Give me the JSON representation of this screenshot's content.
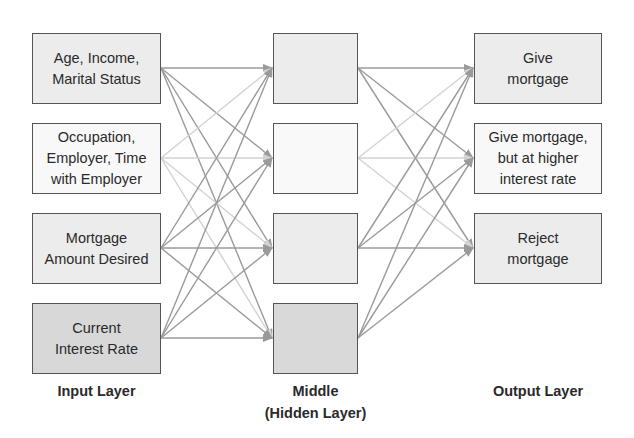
{
  "diagram": {
    "type": "neural-network",
    "input_layer": {
      "label": "Input Layer",
      "nodes": [
        {
          "text": "Age, Income,\nMarital Status",
          "fill": "#ececec"
        },
        {
          "text": "Occupation,\nEmployer, Time\nwith Employer",
          "fill": "#f8f8f8"
        },
        {
          "text": "Mortgage\nAmount Desired",
          "fill": "#ececec"
        },
        {
          "text": "Current\nInterest Rate",
          "fill": "#d8d8d8"
        }
      ]
    },
    "hidden_layer": {
      "label": "Middle\n(Hidden Layer)",
      "nodes": [
        {
          "text": "",
          "fill": "#ececec"
        },
        {
          "text": "",
          "fill": "#f9f9f9"
        },
        {
          "text": "",
          "fill": "#ececec"
        },
        {
          "text": "",
          "fill": "#d9d9d9"
        }
      ]
    },
    "output_layer": {
      "label": "Output Layer",
      "nodes": [
        {
          "text": "Give\nmortgage",
          "fill": "#ececec"
        },
        {
          "text": "Give mortgage,\nbut at higher\ninterest rate",
          "fill": "#f8f8f8"
        },
        {
          "text": "Reject\nmortgage",
          "fill": "#ececec"
        }
      ]
    },
    "connections": "fully connected input→hidden and hidden→output",
    "colors": {
      "edge": "#9a9a9a",
      "edge_light": "#d2d2d2",
      "border": "#555555"
    }
  }
}
